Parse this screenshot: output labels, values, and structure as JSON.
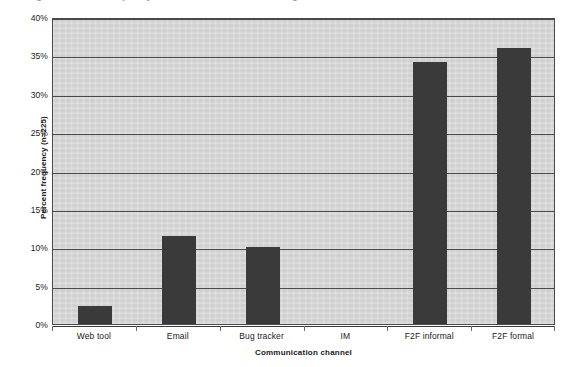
{
  "figure": {
    "cut_off_caption": "Figure 4. Percent frequency of communication channel usage",
    "background_color": "#ffffff"
  },
  "chart_data": {
    "type": "bar",
    "title": "",
    "subtitle": "",
    "xlabel": "Communication channel",
    "ylabel": "Percent frequency (n=225)",
    "categories": [
      "Web tool",
      "Email",
      "Bug tracker",
      "IM",
      "F2F informal",
      "F2F formal"
    ],
    "values": [
      2.3,
      11.5,
      10.0,
      0.0,
      34.2,
      36.0
    ],
    "series": [
      {
        "name": "Percent frequency",
        "values": [
          2.3,
          11.5,
          10.0,
          0.0,
          34.2,
          36.0
        ]
      }
    ],
    "ylim": [
      0,
      40
    ],
    "ytick_values": [
      0,
      5,
      10,
      15,
      20,
      25,
      30,
      35,
      40
    ],
    "ytick_labels": [
      "0%",
      "5%",
      "10%",
      "15%",
      "20%",
      "25%",
      "30%",
      "35%",
      "40%"
    ],
    "grid": true,
    "grid_axis": "y",
    "legend": false,
    "legend_position": "none",
    "bar_color": "#3a3a3a",
    "plot_background_color": "#d7d7d7",
    "axis_color": "#4a4a4a"
  }
}
